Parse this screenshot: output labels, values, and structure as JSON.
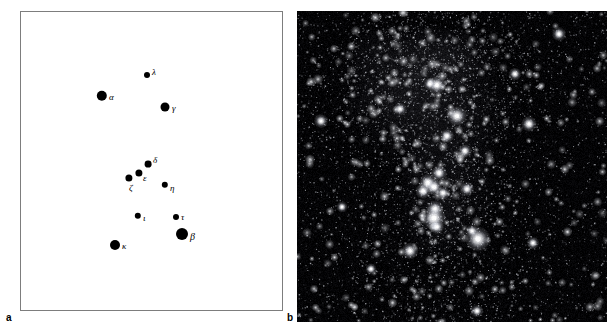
{
  "figure": {
    "background_color": "#ffffff",
    "width": 612,
    "height": 336
  },
  "panels": [
    {
      "id": "a",
      "letter": "a",
      "type": "star-map",
      "description": "Schematic star chart of the constellation Orion with Greek-letter Bayer designations",
      "frame": {
        "x": 20,
        "y": 11,
        "width": 263,
        "height": 300,
        "border_color": "#7d7d7d",
        "fill": "#ffffff"
      },
      "dot_color": "#000000"
    },
    {
      "id": "b",
      "letter": "b",
      "type": "photograph",
      "description": "Wide-field photographic negative-style image of the same Orion field showing dense stars and diffuse nebulosity",
      "frame": {
        "x": 297,
        "y": 11,
        "width": 310,
        "height": 311,
        "background_color": "#030305"
      },
      "star_color": "#ffffff",
      "nebula_color": "#6a6a72"
    }
  ],
  "chart_data": {
    "type": "scatter",
    "title": "",
    "xlabel": "",
    "ylabel": "",
    "xlim": [
      0,
      263
    ],
    "ylim": [
      0,
      300
    ],
    "grid": false,
    "legend": "none",
    "note": "Positions in panel-a local pixel coordinates; radius encodes apparent brightness (larger = brighter).",
    "points": [
      {
        "label": "λ",
        "name": "lambda",
        "x": 126,
        "y": 63,
        "r": 3.0,
        "label_dx": 5,
        "label_dy": -3,
        "label_size": 9
      },
      {
        "label": "α",
        "name": "alpha",
        "x": 81,
        "y": 84,
        "r": 5.2,
        "label_dx": 7,
        "label_dy": 1,
        "label_size": 9
      },
      {
        "label": "γ",
        "name": "gamma",
        "x": 144,
        "y": 95,
        "r": 4.5,
        "label_dx": 7,
        "label_dy": 1,
        "label_size": 9
      },
      {
        "label": "δ",
        "name": "delta",
        "x": 127,
        "y": 152,
        "r": 3.4,
        "label_dx": 5,
        "label_dy": -4,
        "label_size": 9
      },
      {
        "label": "ε",
        "name": "epsilon",
        "x": 118,
        "y": 161,
        "r": 3.6,
        "label_dx": 4,
        "label_dy": 5,
        "label_size": 9
      },
      {
        "label": "ζ",
        "name": "zeta",
        "x": 108,
        "y": 166,
        "r": 3.6,
        "label_dx": 0,
        "label_dy": 10,
        "label_size": 9
      },
      {
        "label": "η",
        "name": "eta",
        "x": 144,
        "y": 173,
        "r": 3.2,
        "label_dx": 5,
        "label_dy": 3,
        "label_size": 9
      },
      {
        "label": "ι",
        "name": "iota",
        "x": 117,
        "y": 204,
        "r": 3.2,
        "label_dx": 5,
        "label_dy": 2,
        "label_size": 9
      },
      {
        "label": "τ",
        "name": "tau",
        "x": 155,
        "y": 205,
        "r": 3.0,
        "label_dx": 5,
        "label_dy": 0,
        "label_size": 9
      },
      {
        "label": "β",
        "name": "beta",
        "x": 161,
        "y": 222,
        "r": 6.0,
        "label_dx": 8,
        "label_dy": 3,
        "label_size": 10
      },
      {
        "label": "κ",
        "name": "kappa",
        "x": 94,
        "y": 233,
        "r": 5.0,
        "label_dx": 7,
        "label_dy": 1,
        "label_size": 9
      }
    ]
  }
}
